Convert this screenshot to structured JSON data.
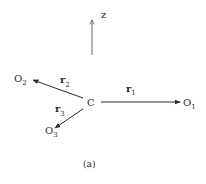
{
  "diagram": {
    "axis": {
      "label": "z"
    },
    "center": {
      "label": "C"
    },
    "vectors": [
      {
        "name": "r",
        "sub": "1",
        "target": "O",
        "target_sub": "1"
      },
      {
        "name": "r",
        "sub": "2",
        "target": "O",
        "target_sub": "2"
      },
      {
        "name": "r",
        "sub": "3",
        "target": "O",
        "target_sub": "3"
      }
    ],
    "caption": "(a)",
    "colors": {
      "ink": "#2a2a2a",
      "background": "#ffffff"
    }
  }
}
